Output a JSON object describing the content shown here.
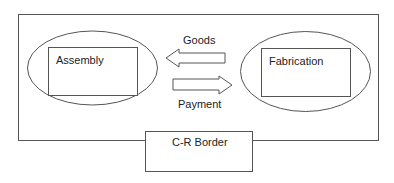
{
  "diagram": {
    "left_unit": {
      "label": "Assembly"
    },
    "right_unit": {
      "label": "Fabrication"
    },
    "top_flow": {
      "label": "Goods",
      "direction": "right-to-left"
    },
    "bottom_flow": {
      "label": "Payment",
      "direction": "left-to-right"
    },
    "border_box": {
      "label": "C-R Border"
    }
  },
  "colors": {
    "stroke": "#555555",
    "text": "#222222",
    "background": "#ffffff"
  }
}
